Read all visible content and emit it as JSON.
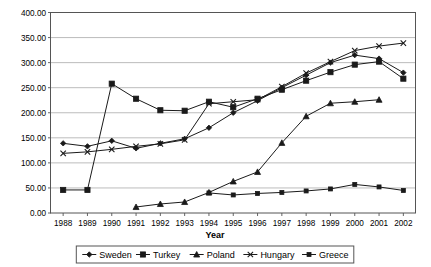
{
  "chart_data": {
    "type": "line",
    "title": "",
    "xlabel": "Year",
    "ylabel": "",
    "grid": true,
    "legend_position": "bottom",
    "x": [
      1988,
      1989,
      1990,
      1991,
      1992,
      1993,
      1994,
      1995,
      1996,
      1997,
      1998,
      1999,
      2000,
      2001,
      2002
    ],
    "xtick_labels": [
      "1988",
      "1989",
      "1990",
      "1991",
      "1992",
      "1993",
      "1994",
      "1995",
      "1996",
      "1997",
      "1998",
      "1999",
      "2000",
      "2001",
      "2002"
    ],
    "ylim": [
      0,
      400
    ],
    "ytick_labels": [
      "0.00",
      "50.00",
      "100.00",
      "150.00",
      "200.00",
      "250.00",
      "300.00",
      "350.00",
      "400.00"
    ],
    "ytick_values": [
      0,
      50,
      100,
      150,
      200,
      250,
      300,
      350,
      400
    ],
    "series": [
      {
        "name": "Sweden",
        "marker": "diamond",
        "values": [
          139,
          133,
          144,
          129,
          139,
          148,
          170,
          200,
          224,
          250,
          275,
          300,
          315,
          308,
          280
        ]
      },
      {
        "name": "Turkey",
        "marker": "square",
        "values": [
          46,
          46,
          258,
          228,
          205,
          204,
          222,
          211,
          228,
          246,
          264,
          281,
          296,
          302,
          268
        ]
      },
      {
        "name": "Poland",
        "marker": "triangle",
        "values": [
          null,
          null,
          null,
          12,
          18,
          22,
          41,
          63,
          82,
          140,
          193,
          219,
          222,
          226,
          null
        ]
      },
      {
        "name": "Hungary",
        "marker": "x",
        "values": [
          119,
          122,
          127,
          133,
          138,
          146,
          218,
          222,
          226,
          252,
          279,
          302,
          324,
          333,
          339
        ]
      },
      {
        "name": "Greece",
        "marker": "square-small",
        "values": [
          null,
          null,
          null,
          null,
          null,
          null,
          40,
          36,
          39,
          41,
          44,
          48,
          57,
          52,
          45
        ]
      }
    ]
  },
  "legend": {
    "entries": [
      {
        "label": "Sweden"
      },
      {
        "label": "Turkey"
      },
      {
        "label": "Poland"
      },
      {
        "label": "Hungary"
      },
      {
        "label": "Greece"
      }
    ]
  }
}
